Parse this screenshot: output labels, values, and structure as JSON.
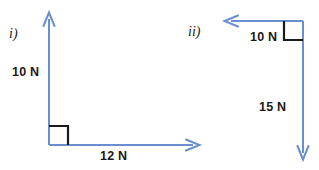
{
  "figure": {
    "background_color": "#ffffff",
    "vector_color": "#6a8fd0",
    "text_color": "#1a1a1a",
    "right_angle_color": "#1a1a1a",
    "width": 319,
    "height": 170
  },
  "diagrams": [
    {
      "id": "i",
      "label": "i)",
      "vertex": {
        "x": 49,
        "y": 145
      },
      "right_angle_marker": "square",
      "vectors": [
        {
          "name": "vertical-force",
          "label": "10 N",
          "magnitude": 10,
          "unit": "N",
          "direction": "up",
          "from": {
            "x": 49,
            "y": 145
          },
          "to": {
            "x": 49,
            "y": 12
          }
        },
        {
          "name": "horizontal-force",
          "label": "12 N",
          "magnitude": 12,
          "unit": "N",
          "direction": "right",
          "from": {
            "x": 49,
            "y": 145
          },
          "to": {
            "x": 200,
            "y": 145
          }
        }
      ]
    },
    {
      "id": "ii",
      "label": "ii)",
      "vertex": {
        "x": 303,
        "y": 21
      },
      "right_angle_marker": "square",
      "vectors": [
        {
          "name": "horizontal-force",
          "label": "10 N",
          "magnitude": 10,
          "unit": "N",
          "direction": "left",
          "from": {
            "x": 303,
            "y": 21
          },
          "to": {
            "x": 224,
            "y": 21
          }
        },
        {
          "name": "vertical-force",
          "label": "15 N",
          "magnitude": 15,
          "unit": "N",
          "direction": "down",
          "from": {
            "x": 303,
            "y": 21
          },
          "to": {
            "x": 303,
            "y": 160
          }
        }
      ]
    }
  ]
}
